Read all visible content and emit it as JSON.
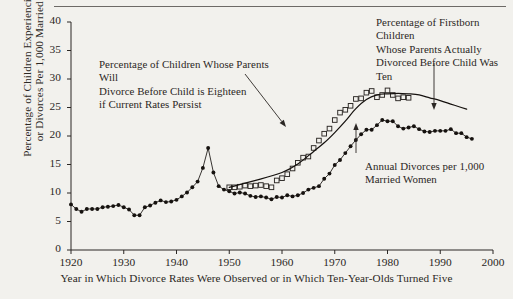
{
  "chart_data": {
    "type": "scatter",
    "title": "",
    "xlabel": "Year in Which Divorce Rates Were Observed or in Which Ten-Year-Olds Turned Five",
    "ylabel": "Percentage of Children Experiencing Divorce or Divorces Per 1,000 Married Women",
    "xlim": [
      1920,
      2000
    ],
    "ylim": [
      0,
      40
    ],
    "xticks": [
      1920,
      1930,
      1940,
      1950,
      1960,
      1970,
      1980,
      1990,
      2000
    ],
    "yticks": [
      0,
      5,
      10,
      15,
      20,
      25,
      30,
      35,
      40
    ],
    "grid": false,
    "legend_position": "annotations",
    "annotations": [
      {
        "name": "projection-annotation",
        "lines": [
          "Percentage of Children Whose Parents Will",
          "Divorce Before Child is Eighteen",
          "if Current Rates Persist"
        ],
        "arrow": "diagonal-down-right",
        "target_year": 1968,
        "target_value": 18.5
      },
      {
        "name": "firstborn-annotation",
        "lines": [
          "Percentage of Firstborn Children",
          "Whose Parents Actually",
          "Divorced Before Child Was Ten"
        ],
        "arrow": "vertical-down",
        "target_year": 1984,
        "target_value": 27.0
      },
      {
        "name": "divorce-rate-annotation",
        "lines": [
          "Annual Divorces per 1,000",
          "Married Women"
        ],
        "arrow": "vertical-up",
        "target_year": 1979,
        "target_value": 21.2
      }
    ],
    "series": [
      {
        "name": "Annual Divorces per 1,000 Married Women",
        "marker": "filled-circle",
        "line": true,
        "color": "#16120f",
        "points": [
          [
            1920,
            8.0
          ],
          [
            1921,
            7.2
          ],
          [
            1922,
            6.7
          ],
          [
            1923,
            7.2
          ],
          [
            1924,
            7.2
          ],
          [
            1925,
            7.2
          ],
          [
            1926,
            7.5
          ],
          [
            1927,
            7.6
          ],
          [
            1928,
            7.7
          ],
          [
            1929,
            7.9
          ],
          [
            1930,
            7.5
          ],
          [
            1931,
            7.1
          ],
          [
            1932,
            6.1
          ],
          [
            1933,
            6.1
          ],
          [
            1934,
            7.5
          ],
          [
            1935,
            7.8
          ],
          [
            1936,
            8.3
          ],
          [
            1937,
            8.7
          ],
          [
            1938,
            8.4
          ],
          [
            1939,
            8.5
          ],
          [
            1940,
            8.8
          ],
          [
            1941,
            9.4
          ],
          [
            1942,
            10.1
          ],
          [
            1943,
            11.0
          ],
          [
            1944,
            12.0
          ],
          [
            1945,
            14.4
          ],
          [
            1946,
            17.9
          ],
          [
            1947,
            13.6
          ],
          [
            1948,
            11.2
          ],
          [
            1949,
            10.6
          ],
          [
            1950,
            10.3
          ],
          [
            1951,
            9.9
          ],
          [
            1952,
            10.1
          ],
          [
            1953,
            9.9
          ],
          [
            1954,
            9.5
          ],
          [
            1955,
            9.3
          ],
          [
            1956,
            9.4
          ],
          [
            1957,
            9.2
          ],
          [
            1958,
            8.9
          ],
          [
            1959,
            9.3
          ],
          [
            1960,
            9.2
          ],
          [
            1961,
            9.6
          ],
          [
            1962,
            9.4
          ],
          [
            1963,
            9.6
          ],
          [
            1964,
            10.0
          ],
          [
            1965,
            10.6
          ],
          [
            1966,
            10.9
          ],
          [
            1967,
            11.2
          ],
          [
            1968,
            12.5
          ],
          [
            1969,
            13.4
          ],
          [
            1970,
            14.9
          ],
          [
            1971,
            15.8
          ],
          [
            1972,
            17.0
          ],
          [
            1973,
            18.2
          ],
          [
            1974,
            19.3
          ],
          [
            1975,
            20.3
          ],
          [
            1976,
            21.1
          ],
          [
            1977,
            21.1
          ],
          [
            1978,
            21.9
          ],
          [
            1979,
            22.8
          ],
          [
            1980,
            22.6
          ],
          [
            1981,
            22.6
          ],
          [
            1982,
            21.7
          ],
          [
            1983,
            21.3
          ],
          [
            1984,
            21.5
          ],
          [
            1985,
            21.7
          ],
          [
            1986,
            21.2
          ],
          [
            1987,
            20.8
          ],
          [
            1988,
            20.7
          ],
          [
            1989,
            20.9
          ],
          [
            1990,
            20.9
          ],
          [
            1991,
            20.9
          ],
          [
            1992,
            21.2
          ],
          [
            1993,
            20.5
          ],
          [
            1994,
            20.5
          ],
          [
            1995,
            19.8
          ],
          [
            1996,
            19.5
          ]
        ]
      },
      {
        "name": "Percentage of Firstborn Children Whose Parents Actually Divorced Before Child Was Ten",
        "marker": "open-square",
        "line": false,
        "color": "#2b2724",
        "points": [
          [
            1950,
            11.0
          ],
          [
            1951,
            11.0
          ],
          [
            1952,
            11.1
          ],
          [
            1953,
            11.3
          ],
          [
            1954,
            11.2
          ],
          [
            1955,
            11.3
          ],
          [
            1956,
            11.4
          ],
          [
            1957,
            11.2
          ],
          [
            1958,
            11.0
          ],
          [
            1959,
            12.2
          ],
          [
            1960,
            12.6
          ],
          [
            1961,
            13.3
          ],
          [
            1962,
            14.3
          ],
          [
            1963,
            15.3
          ],
          [
            1964,
            16.2
          ],
          [
            1965,
            16.4
          ],
          [
            1966,
            17.9
          ],
          [
            1967,
            19.2
          ],
          [
            1968,
            20.4
          ],
          [
            1969,
            21.3
          ],
          [
            1970,
            22.8
          ],
          [
            1971,
            24.1
          ],
          [
            1972,
            24.6
          ],
          [
            1973,
            25.3
          ],
          [
            1974,
            26.5
          ],
          [
            1975,
            26.6
          ],
          [
            1976,
            27.6
          ],
          [
            1977,
            27.9
          ],
          [
            1978,
            26.8
          ],
          [
            1979,
            27.2
          ],
          [
            1980,
            28.0
          ],
          [
            1981,
            27.2
          ],
          [
            1982,
            26.6
          ],
          [
            1983,
            26.8
          ],
          [
            1984,
            26.7
          ]
        ]
      },
      {
        "name": "Percentage of Children Whose Parents Will Divorce Before Child is Eighteen if Current Rates Persist",
        "marker": "none",
        "line": true,
        "color": "#16120f",
        "points": [
          [
            1950,
            11.0
          ],
          [
            1955,
            12.2
          ],
          [
            1960,
            13.6
          ],
          [
            1963,
            15.1
          ],
          [
            1966,
            17.3
          ],
          [
            1968,
            18.8
          ],
          [
            1970,
            20.6
          ],
          [
            1972,
            22.6
          ],
          [
            1974,
            24.8
          ],
          [
            1976,
            26.4
          ],
          [
            1978,
            27.2
          ],
          [
            1980,
            27.4
          ],
          [
            1982,
            27.5
          ],
          [
            1984,
            27.4
          ],
          [
            1986,
            27.2
          ],
          [
            1988,
            26.7
          ],
          [
            1990,
            26.2
          ],
          [
            1992,
            25.6
          ],
          [
            1994,
            25.0
          ],
          [
            1995,
            24.7
          ]
        ]
      }
    ]
  }
}
